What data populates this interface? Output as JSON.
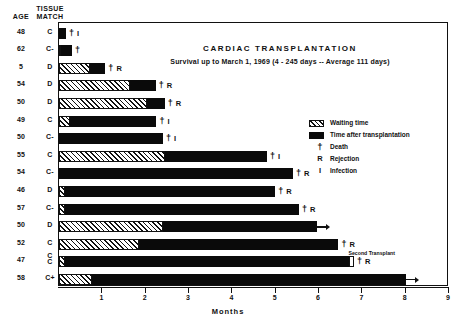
{
  "headers": {
    "age": "AGE",
    "tissue_line1": "TISSUE",
    "tissue_line2": "MATCH"
  },
  "titles": {
    "main": "CARDIAC TRANSPLANTATION",
    "sub": "Survival up to March 1, 1969  (4 - 245 days -- Average 111 days)"
  },
  "legend": {
    "items": [
      {
        "kind": "swatch-wait",
        "glyph": "",
        "label": "Waiting time"
      },
      {
        "kind": "swatch-post",
        "glyph": "",
        "label": "Time after transplantation"
      },
      {
        "kind": "glyph-dagger",
        "glyph": "†",
        "label": "Death"
      },
      {
        "kind": "glyph",
        "glyph": "R",
        "label": "Rejection"
      },
      {
        "kind": "glyph",
        "glyph": "I",
        "label": "Infection"
      }
    ]
  },
  "axis": {
    "label": "Months",
    "ticks": [
      "1",
      "2",
      "3",
      "4",
      "5",
      "6",
      "7",
      "8",
      "9"
    ],
    "min": 0,
    "max": 9
  },
  "annotations": {
    "second_transplant": "Second Transplant"
  },
  "caption": "",
  "colors": {
    "ink": "#111111",
    "bar_post": "#0a0a0a",
    "background": "#ffffff"
  },
  "chart_data": {
    "type": "bar",
    "title": "CARDIAC TRANSPLANTATION",
    "subtitle": "Survival up to March 1, 1969  (4 - 245 days -- Average 111 days)",
    "xlabel": "Months",
    "ylabel": "",
    "xlim": [
      0,
      9
    ],
    "grid": false,
    "legend_position": "upper-right",
    "orientation": "horizontal",
    "stacked": true,
    "series": [
      {
        "name": "Waiting time",
        "pattern": "hatched"
      },
      {
        "name": "Time after transplantation",
        "pattern": "solid-black"
      }
    ],
    "event_glyphs": {
      "dagger": "Death",
      "R": "Rejection",
      "I": "Infection"
    },
    "rows": [
      {
        "age": "48",
        "match": "C",
        "wait": 0.0,
        "post": 0.16,
        "ongoing": false,
        "events": [
          "†",
          "I"
        ]
      },
      {
        "age": "62",
        "match": "C-",
        "wait": 0.05,
        "post": 0.25,
        "ongoing": false,
        "events": [
          "†"
        ]
      },
      {
        "age": "5",
        "match": "D",
        "wait": 0.72,
        "post": 0.35,
        "ongoing": false,
        "events": [
          "†",
          "R"
        ]
      },
      {
        "age": "54",
        "match": "D",
        "wait": 1.63,
        "post": 0.6,
        "ongoing": false,
        "events": [
          "†",
          "R"
        ]
      },
      {
        "age": "50",
        "match": "D",
        "wait": 2.02,
        "post": 0.42,
        "ongoing": false,
        "events": [
          "†",
          "R"
        ]
      },
      {
        "age": "49",
        "match": "C",
        "wait": 0.25,
        "post": 2.0,
        "ongoing": false,
        "events": [
          "†",
          "I"
        ]
      },
      {
        "age": "50",
        "match": "C-",
        "wait": 0.0,
        "post": 2.4,
        "ongoing": false,
        "events": [
          "†",
          "I"
        ]
      },
      {
        "age": "55",
        "match": "C",
        "wait": 2.45,
        "post": 2.35,
        "ongoing": false,
        "events": [
          "†",
          "I"
        ]
      },
      {
        "age": "54",
        "match": "C-",
        "wait": 0.0,
        "post": 5.4,
        "ongoing": false,
        "events": [
          "†",
          "R"
        ]
      },
      {
        "age": "46",
        "match": "D",
        "wait": 0.14,
        "post": 4.85,
        "ongoing": false,
        "events": [
          "†",
          "R"
        ]
      },
      {
        "age": "57",
        "match": "C-",
        "wait": 0.14,
        "post": 5.4,
        "ongoing": false,
        "events": [
          "†",
          "R"
        ]
      },
      {
        "age": "50",
        "match": "D",
        "wait": 2.4,
        "post": 3.55,
        "ongoing": true,
        "events": []
      },
      {
        "age": "52",
        "match": "C",
        "wait": 1.85,
        "post": 4.6,
        "ongoing": false,
        "events": [
          "†",
          "R"
        ],
        "note": "Second Transplant"
      },
      {
        "age": "47",
        "match": "C C",
        "wait": 0.14,
        "post": 6.55,
        "ongoing": false,
        "events": [
          "†",
          "R"
        ],
        "gap_after": true
      },
      {
        "age": "58",
        "match": "C+",
        "wait": 0.75,
        "post": 7.25,
        "ongoing": true,
        "events": []
      }
    ]
  }
}
